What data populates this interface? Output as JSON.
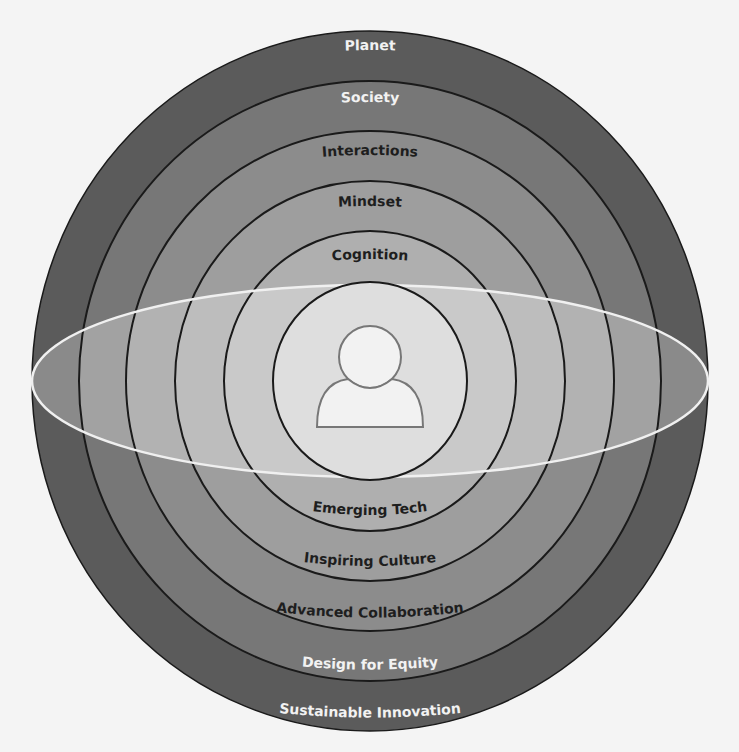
{
  "diagram": {
    "center_icon": "person-icon",
    "colors": {
      "background": "#f4f4f4",
      "ring_1": "#5b5b5b",
      "ring_2": "#777777",
      "ring_3": "#8c8c8c",
      "ring_4": "#9e9e9e",
      "ring_5": "#afafaf",
      "core": "#d4d4d4",
      "band_stroke": "#f0f0f0",
      "outline": "#1a1a1a"
    },
    "top_labels": [
      {
        "text": "Planet"
      },
      {
        "text": "Society"
      },
      {
        "text": "Interactions"
      },
      {
        "text": "Mindset"
      },
      {
        "text": "Cognition"
      }
    ],
    "bottom_labels": [
      {
        "text": "Emerging Tech"
      },
      {
        "text": "Inspiring Culture"
      },
      {
        "text": "Advanced Collaboration"
      },
      {
        "text": "Design for Equity"
      },
      {
        "text": "Sustainable Innovation"
      }
    ]
  }
}
